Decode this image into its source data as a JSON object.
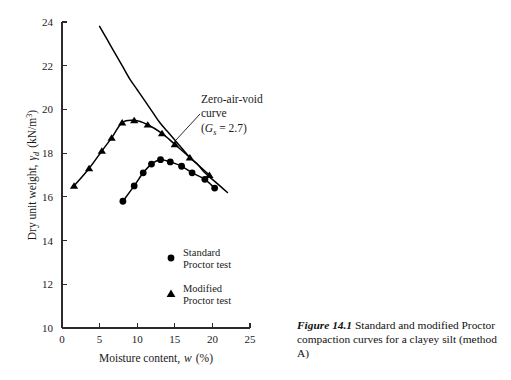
{
  "figure": {
    "caption_label": "Figure 14.1",
    "caption_text": "Standard and modified Proctor compaction curves for a clayey silt (method A)"
  },
  "axes": {
    "x_title_main": "Moisture content,",
    "x_title_sym": "w",
    "x_title_unit": "(%)",
    "y_title_main": "Dry unit weight,",
    "y_title_sym": "γ",
    "y_title_sub": "d",
    "y_title_unit": "(kN/m",
    "y_title_sup": "3",
    "y_title_close": ")",
    "x_ticks": [
      0,
      5,
      10,
      15,
      20,
      25
    ],
    "y_ticks": [
      10,
      12,
      14,
      16,
      18,
      20,
      22,
      24
    ],
    "x_min": 0,
    "x_max": 25,
    "y_min": 10,
    "y_max": 24
  },
  "annotation": {
    "line1": "Zero-air-void",
    "line2": "curve",
    "line3_open": "(",
    "line3_sym": "G",
    "line3_sub": "s",
    "line3_rest": " = 2.7)"
  },
  "legend": {
    "items": [
      {
        "marker": "circle-marker",
        "line1": "Standard",
        "line2": "Proctor test"
      },
      {
        "marker": "triangle-marker",
        "line1": "Modified",
        "line2": "Proctor test"
      }
    ]
  },
  "colors": {
    "curve": "#000000",
    "axis": "#2b2b2b",
    "text": "#1a1a1a",
    "background": "#ffffff"
  },
  "chart_data": {
    "type": "line",
    "title": "Standard and modified Proctor compaction curves for a clayey silt (method A)",
    "xlabel": "Moisture content, w (%)",
    "ylabel": "Dry unit weight, γd (kN/m3)",
    "xlim": [
      0,
      25
    ],
    "ylim": [
      10,
      24
    ],
    "xticks": [
      0,
      5,
      10,
      15,
      20,
      25
    ],
    "yticks": [
      10,
      12,
      14,
      16,
      18,
      20,
      22,
      24
    ],
    "grid": false,
    "legend_position": "inside-lower-center",
    "annotations": [
      {
        "text": "Zero-air-void curve (Gs = 2.7)",
        "points_to_x": 14.4,
        "points_to_y": 19.0
      }
    ],
    "series": [
      {
        "name": "Modified Proctor test",
        "marker": "triangle",
        "x": [
          1.6,
          3.6,
          5.3,
          6.6,
          8.0,
          9.6,
          11.4,
          13.3,
          15.0,
          17.0,
          19.6
        ],
        "y": [
          16.5,
          17.3,
          18.1,
          18.7,
          19.4,
          19.5,
          19.3,
          18.9,
          18.4,
          17.8,
          17.0
        ]
      },
      {
        "name": "Standard Proctor test",
        "marker": "circle",
        "x": [
          8.1,
          9.6,
          10.8,
          11.9,
          13.1,
          14.4,
          15.9,
          17.3,
          19.0,
          20.3
        ],
        "y": [
          15.8,
          16.5,
          17.1,
          17.5,
          17.7,
          17.6,
          17.4,
          17.1,
          16.8,
          16.4
        ]
      },
      {
        "name": "Zero-air-void curve (Gs = 2.7)",
        "marker": "none",
        "x": [
          5.0,
          6.0,
          7.0,
          8.0,
          9.0,
          10.0,
          11.0,
          12.0,
          13.0,
          14.0,
          15.0,
          16.0,
          17.0,
          18.0,
          19.0,
          20.0,
          21.0,
          22.0
        ],
        "y": [
          23.8,
          23.2,
          22.6,
          22.0,
          21.4,
          20.9,
          20.4,
          19.9,
          19.4,
          19.0,
          18.6,
          18.2,
          17.8,
          17.5,
          17.1,
          16.8,
          16.5,
          16.2
        ]
      }
    ]
  }
}
